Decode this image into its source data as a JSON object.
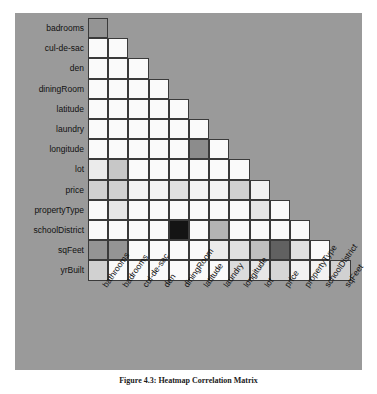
{
  "figure": {
    "caption": "Figure 4.3: Heatmap Correlation Matrix",
    "background_color": "#9a9a9a",
    "cell_border_color": "#3a3a3a"
  },
  "chart_data": {
    "type": "heatmap",
    "title": "Figure 4.3: Heatmap Correlation Matrix",
    "xlabel": "",
    "ylabel": "",
    "grid": true,
    "legend": "none",
    "shape": "lower-triangular",
    "colormap": "grayscale-white-to-black",
    "value_range": [
      0,
      1
    ],
    "x": [
      "bathrooms",
      "badrooms",
      "cul-de-sac",
      "den",
      "diningRoom",
      "latitude",
      "laundry",
      "longitude",
      "lot",
      "price",
      "propertyType",
      "schoolDistrict",
      "sqFeet"
    ],
    "y": [
      "badrooms",
      "cul-de-sac",
      "den",
      "diningRoom",
      "latitude",
      "laundry",
      "longitude",
      "lot",
      "price",
      "propertyType",
      "schoolDistrict",
      "sqFeet",
      "yrBuilt"
    ],
    "rows": [
      {
        "label": "badrooms",
        "values": [
          0.42
        ]
      },
      {
        "label": "cul-de-sac",
        "values": [
          0.02,
          0.02
        ]
      },
      {
        "label": "den",
        "values": [
          0.02,
          0.02,
          0.02
        ]
      },
      {
        "label": "diningRoom",
        "values": [
          0.02,
          0.02,
          0.02,
          0.02
        ]
      },
      {
        "label": "latitude",
        "values": [
          0.02,
          0.02,
          0.02,
          0.02,
          0.02
        ]
      },
      {
        "label": "laundry",
        "values": [
          0.02,
          0.02,
          0.02,
          0.02,
          0.02,
          0.02
        ]
      },
      {
        "label": "longitude",
        "values": [
          0.02,
          0.02,
          0.02,
          0.02,
          0.02,
          0.45,
          0.02
        ]
      },
      {
        "label": "lot",
        "values": [
          0.08,
          0.22,
          0.02,
          0.02,
          0.02,
          0.02,
          0.02,
          0.02
        ]
      },
      {
        "label": "price",
        "values": [
          0.18,
          0.18,
          0.05,
          0.05,
          0.12,
          0.05,
          0.05,
          0.18,
          0.05
        ]
      },
      {
        "label": "propertyType",
        "values": [
          0.02,
          0.1,
          0.02,
          0.02,
          0.02,
          0.02,
          0.02,
          0.02,
          0.1,
          0.02
        ]
      },
      {
        "label": "schoolDistrict",
        "values": [
          0.02,
          0.02,
          0.02,
          0.02,
          0.92,
          0.02,
          0.3,
          0.02,
          0.02,
          0.02,
          0.02
        ]
      },
      {
        "label": "sqFeet",
        "values": [
          0.42,
          0.42,
          0.02,
          0.02,
          0.02,
          0.02,
          0.08,
          0.12,
          0.25,
          0.62,
          0.12,
          0.02
        ]
      },
      {
        "label": "yrBuilt",
        "values": [
          0.18,
          0.02,
          0.02,
          0.02,
          0.02,
          0.02,
          0.02,
          0.14,
          0.1,
          0.16,
          0.05,
          0.05,
          0.18
        ]
      }
    ]
  }
}
